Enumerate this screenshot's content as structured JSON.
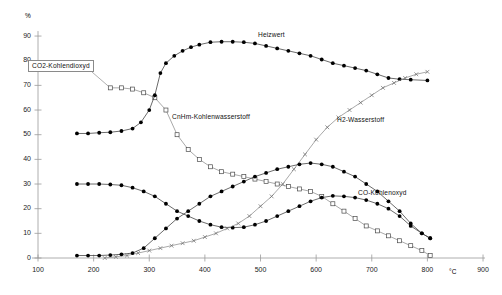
{
  "chart_data": {
    "type": "line",
    "title": "",
    "xlabel": "°C",
    "ylabel": "%",
    "xlim": [
      100,
      900
    ],
    "ylim": [
      0,
      90
    ],
    "xticks": [
      100,
      200,
      300,
      400,
      500,
      600,
      700,
      800,
      900
    ],
    "yticks": [
      0,
      10,
      20,
      30,
      40,
      50,
      60,
      70,
      80,
      90
    ],
    "grid": false,
    "legend_position": "inline-annotations",
    "series": [
      {
        "name": "CO2-Kohlendioxyd",
        "marker": "open-square",
        "label_boxed": true,
        "x": [
          230,
          250,
          270,
          290,
          310,
          330,
          350,
          370,
          390,
          410,
          430,
          450,
          470,
          490,
          510,
          530,
          550,
          570,
          590,
          610,
          630,
          650,
          670,
          690,
          710,
          730,
          750,
          770,
          790,
          805
        ],
        "values": [
          69,
          69,
          68.5,
          67,
          65,
          60,
          50,
          44,
          40,
          37,
          35,
          34,
          33,
          32,
          31,
          30,
          29,
          28,
          27,
          25,
          22,
          19,
          16,
          13,
          11,
          9,
          7,
          5,
          3,
          1
        ]
      },
      {
        "name": "Heizwert",
        "marker": "filled-circle",
        "label_boxed": false,
        "x": [
          170,
          190,
          210,
          230,
          250,
          270,
          285,
          300,
          310,
          320,
          330,
          345,
          360,
          375,
          390,
          410,
          430,
          450,
          470,
          490,
          510,
          530,
          550,
          570,
          590,
          610,
          630,
          650,
          670,
          690,
          710,
          730,
          750,
          770,
          800
        ],
        "values": [
          50.5,
          50.5,
          50.8,
          51,
          51.5,
          52.5,
          55,
          60,
          66,
          75,
          79,
          82,
          84,
          85.5,
          86.5,
          87.5,
          87.7,
          87.7,
          87.5,
          87,
          86,
          85,
          84,
          83,
          82,
          80.5,
          79,
          78,
          77,
          76,
          74.5,
          73,
          72.5,
          72.3,
          72
        ]
      },
      {
        "name": "CnHm-Kohlenwasserstoff",
        "marker": "filled-circle",
        "label_boxed": false,
        "x": [
          170,
          190,
          210,
          230,
          250,
          270,
          290,
          310,
          330,
          350,
          370,
          390,
          410,
          430,
          450,
          470,
          490,
          510,
          530,
          550,
          570,
          590,
          610,
          630,
          650,
          670,
          690,
          710,
          730,
          750,
          770,
          790,
          805
        ],
        "values": [
          30,
          30,
          30,
          29.8,
          29.5,
          28.5,
          27,
          25,
          22,
          19,
          17,
          15,
          13.5,
          12.5,
          12.3,
          12.5,
          13.5,
          15,
          17,
          19,
          21,
          23,
          24.5,
          25.2,
          25,
          24.5,
          23.5,
          22,
          20,
          17,
          13,
          10,
          8
        ]
      },
      {
        "name": "H2-Wasserstoff",
        "marker": "x-cross",
        "label_boxed": false,
        "x": [
          220,
          240,
          260,
          280,
          300,
          320,
          340,
          360,
          380,
          400,
          420,
          440,
          460,
          480,
          500,
          520,
          540,
          560,
          580,
          600,
          620,
          640,
          660,
          680,
          700,
          720,
          740,
          760,
          780,
          800
        ],
        "values": [
          0,
          0.5,
          1,
          2,
          3,
          4,
          5,
          6,
          7,
          8.5,
          10,
          12,
          14,
          17,
          21,
          25,
          30,
          36,
          42,
          48,
          53,
          57,
          60,
          63,
          66,
          69,
          71,
          73,
          74.5,
          75.5
        ]
      },
      {
        "name": "CO-Kohlenoxyd",
        "marker": "filled-circle",
        "label_boxed": false,
        "x": [
          170,
          190,
          210,
          230,
          250,
          270,
          290,
          310,
          330,
          350,
          370,
          390,
          410,
          430,
          450,
          470,
          490,
          510,
          530,
          550,
          570,
          590,
          610,
          630,
          650,
          670,
          690,
          710,
          730,
          750,
          770,
          790,
          805
        ],
        "values": [
          1,
          1,
          1,
          1.2,
          1.5,
          2,
          4,
          8,
          12,
          16,
          19,
          22,
          25,
          27,
          29,
          31,
          33,
          34.5,
          36,
          37,
          38,
          38.5,
          38,
          37,
          35,
          33,
          30,
          27,
          23,
          19,
          14,
          10,
          8
        ]
      }
    ]
  },
  "axes": {
    "y_unit": "%",
    "x_unit": "°C",
    "ytick_labels": [
      "90",
      "80",
      "70",
      "60",
      "50",
      "40",
      "30",
      "20",
      "10",
      "0"
    ],
    "xtick_labels": [
      "100",
      "200",
      "300",
      "400",
      "500",
      "600",
      "700",
      "800",
      "900"
    ]
  },
  "annotations": {
    "co2": "CO2-Kohlendioxyd",
    "cnhm": "CnHm-Kohlenwasserstoff",
    "heizwert": "Heizwert",
    "h2": "H2-Wasserstoff",
    "co": "CO-Kohlenoxyd"
  }
}
